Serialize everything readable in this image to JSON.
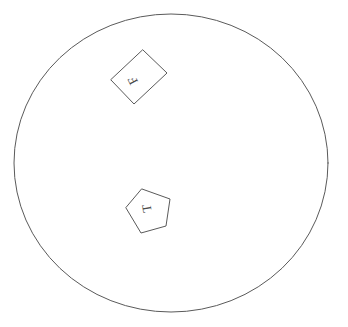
{
  "canvas": {
    "width": 348,
    "height": 327,
    "background_color": "#ffffff",
    "stroke_color": "#5a5a5a",
    "glyph_color": "#4a4a4a",
    "title": "Circle with two labeled quadrilaterals"
  },
  "boundary": {
    "name": "circle",
    "center_x": 171,
    "center_y": 163,
    "radius_x": 157,
    "radius_y": 149,
    "stroke_width": 1,
    "fill": "none"
  },
  "shapes": [
    {
      "id": "upper-quad",
      "label": "F",
      "label_rotation": -118,
      "label_x": 134,
      "label_y": 80,
      "rotation": 0,
      "points": "143,50 167,73 134,104 111,80",
      "center_x": 139,
      "center_y": 77
    },
    {
      "id": "lower-quad",
      "label": "T",
      "label_rotation": -100,
      "label_y": 208,
      "label_x": 148,
      "rotation": 0,
      "points": "142,189 170,199 166,226 141,233 126,208",
      "center_x": 149,
      "center_y": 209
    }
  ]
}
